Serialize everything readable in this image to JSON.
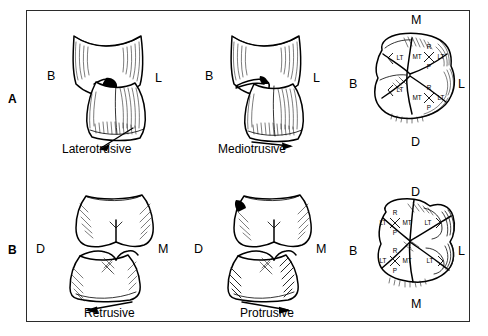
{
  "figure": {
    "background": "#ffffff",
    "ink_color": "#000000",
    "border_color": "#2b2b2b"
  },
  "panels": [
    {
      "letter": "A",
      "view": "buccal-and-occlusal-maxillary",
      "cells": [
        {
          "name": "laterotrusive",
          "caption": "Laterotrusive",
          "view_type": "buccal",
          "left_label": "B",
          "right_label": "L",
          "arrow_direction": "down-left"
        },
        {
          "name": "mediotrusive",
          "caption": "Mediotrusive",
          "view_type": "buccal",
          "left_label": "B",
          "right_label": "L",
          "arrow_direction": "right"
        },
        {
          "name": "maxillary-occlusal",
          "view_type": "occlusal",
          "top_label": "M",
          "bottom_label": "D",
          "left_label": "B",
          "right_label": "L",
          "cusp_markers": [
            {
              "position": "mesiobuccal",
              "type": "single",
              "labels": [
                "LT"
              ]
            },
            {
              "position": "distobuccal",
              "type": "single",
              "labels": [
                "LT"
              ]
            },
            {
              "position": "mesiolingual",
              "type": "cross",
              "top": "R",
              "left": "MT",
              "right": "LT",
              "bottom": "P"
            },
            {
              "position": "distolingual",
              "type": "cross",
              "top": "R",
              "left": "MT",
              "right": "LT",
              "bottom": "P"
            }
          ]
        }
      ]
    },
    {
      "letter": "B",
      "view": "mesiodistal-and-occlusal-mandibular",
      "cells": [
        {
          "name": "retrusive",
          "caption": "Retrusive",
          "view_type": "proximal",
          "left_label": "D",
          "right_label": "M",
          "arrow_direction": "left"
        },
        {
          "name": "protrusive",
          "caption": "Protrusive",
          "view_type": "proximal",
          "left_label": "D",
          "right_label": "M",
          "arrow_direction": "right"
        },
        {
          "name": "mandibular-occlusal",
          "view_type": "occlusal",
          "top_label": "D",
          "bottom_label": "M",
          "left_label": "B",
          "right_label": "L",
          "cusp_markers": [
            {
              "position": "distobuccal",
              "type": "cross",
              "top": "R",
              "left": "LT",
              "right": "MT",
              "bottom": "P"
            },
            {
              "position": "mesiobuccal",
              "type": "cross",
              "top": "R",
              "left": "LT",
              "right": "MT",
              "bottom": "P"
            },
            {
              "position": "distolingual",
              "type": "single",
              "labels": [
                "LT"
              ]
            },
            {
              "position": "mesiolingual",
              "type": "single",
              "labels": [
                "LT"
              ]
            }
          ]
        }
      ]
    }
  ],
  "legend_keys": {
    "LT": "Laterotrusive",
    "MT": "Mediotrusive",
    "R": "Retrusive",
    "P": "Protrusive",
    "B": "Buccal",
    "L": "Lingual",
    "M": "Mesial",
    "D": "Distal"
  }
}
